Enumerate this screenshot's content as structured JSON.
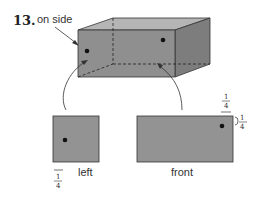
{
  "problem": {
    "number": "13.",
    "callout": "on side"
  },
  "views": {
    "left": {
      "label": "left",
      "fraction": {
        "num": "1",
        "den": "4"
      }
    },
    "front": {
      "label": "front",
      "fraction_top": {
        "num": "1",
        "den": "4"
      },
      "fraction_side": {
        "num": "1",
        "den": "4"
      }
    }
  },
  "colors": {
    "face_front": "#8f8f8f",
    "face_top": "#b5b5b5",
    "face_right": "#7d7d7d",
    "view_fill": "#939393",
    "dot": "#111111",
    "edge": "#333333"
  }
}
